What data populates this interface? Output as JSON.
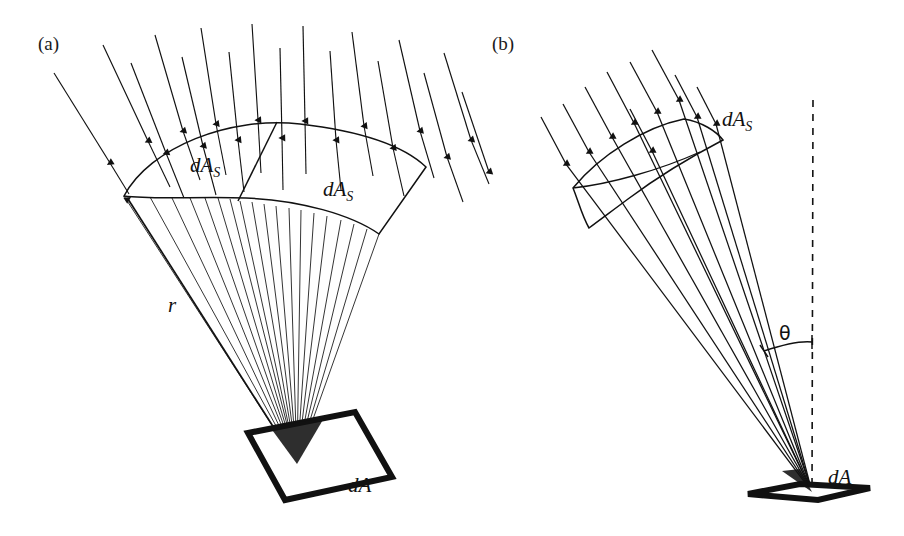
{
  "figure": {
    "background_color": "#ffffff",
    "ink_color": "#111111",
    "width": 904,
    "height": 536
  },
  "panels": [
    {
      "key": "a",
      "label": "(a)",
      "label_x": 38,
      "label_y": 50,
      "description": "Normal incidence: rays converge radially onto dA; two spherical surface patches dA_S shown at radius r.",
      "labels": [
        {
          "name": "dA_S_left",
          "text": "dA",
          "sub": "S",
          "x": 190,
          "y": 172
        },
        {
          "name": "dA_S_right",
          "text": "dA",
          "sub": "S",
          "x": 323,
          "y": 196
        },
        {
          "name": "radius",
          "text": "r",
          "sub": "",
          "x": 168,
          "y": 312
        },
        {
          "name": "dA",
          "text": "dA",
          "sub": "",
          "x": 348,
          "y": 492
        }
      ]
    },
    {
      "key": "b",
      "label": "(b)",
      "label_x": 492,
      "label_y": 50,
      "description": "Oblique incidence: parallel rays strike the foreshortened dA at angle theta from the dashed surface normal.",
      "labels": [
        {
          "name": "dA_S",
          "text": "dA",
          "sub": "S",
          "x": 722,
          "y": 126
        },
        {
          "name": "theta",
          "text": "θ",
          "sub": "",
          "x": 779,
          "y": 340
        },
        {
          "name": "dA",
          "text": "dA",
          "sub": "",
          "x": 828,
          "y": 484
        }
      ]
    }
  ],
  "geometry": {
    "panel_a": {
      "apex": {
        "x": 297,
        "y": 464
      },
      "band_left_tip": {
        "x": 124,
        "y": 196
      },
      "band_right_top": {
        "x": 426,
        "y": 167
      },
      "band_right_bottom": {
        "x": 379,
        "y": 234
      },
      "divider_top": {
        "x": 277,
        "y": 129
      },
      "divider_bottom": {
        "x": 240,
        "y": 203
      },
      "ray_count": 17,
      "spoke_count": 19,
      "square": {
        "points": "248,433 355,412 392,477 285,500",
        "stroke_width": 6
      }
    },
    "panel_b": {
      "apex": {
        "x": 812,
        "y": 492
      },
      "patch_left_tip": {
        "x": 573,
        "y": 188
      },
      "patch_top_right": {
        "x": 684,
        "y": 119
      },
      "patch_right_tip": {
        "x": 723,
        "y": 140
      },
      "ray_count": 9,
      "normal_line": {
        "x1": 813,
        "y1": 100,
        "x2": 812,
        "y2": 494,
        "dash": "7 7"
      },
      "angle_arc": {
        "radius": 150,
        "theta_deg": 19
      },
      "parallelogram": {
        "points": "748,494 800,484 870,488 818,500",
        "stroke_width": 6
      }
    }
  }
}
